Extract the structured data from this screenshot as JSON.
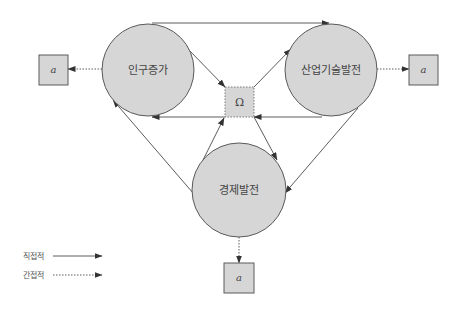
{
  "nodes": {
    "population": {
      "label": "인구증가"
    },
    "industry": {
      "label": "산업기술발전"
    },
    "economy": {
      "label": "경제발전"
    },
    "omega": {
      "label": "Ω"
    },
    "output_left": {
      "label": "a"
    },
    "output_right": {
      "label": "a"
    },
    "output_bottom": {
      "label": "a"
    }
  },
  "legend": {
    "direct": {
      "label": "직접적",
      "style": "solid"
    },
    "indirect": {
      "label": "간접적",
      "style": "dotted"
    }
  },
  "colors": {
    "node_fill": "#d6d6d6",
    "stroke": "#4a4a4a",
    "text": "#444444"
  }
}
